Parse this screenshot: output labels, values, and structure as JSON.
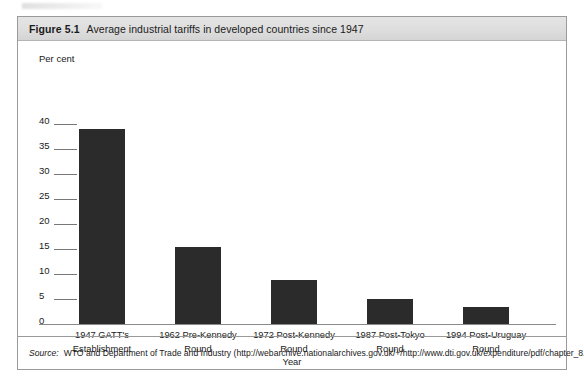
{
  "figure": {
    "number": "Figure 5.1",
    "title": "Average industrial tariffs in developed countries since 1947",
    "source_label": "Source:",
    "source_text": "WTO and Department of Trade and Industry (http://webarchive.nationalarchives.gov.uk/+/http://www.dti.gov.uk/expenditure/pdf/chapter_8.pdf)."
  },
  "chart_data": {
    "type": "bar",
    "title": "Average industrial tariffs in developed countries since 1947",
    "xlabel": "Year",
    "ylabel": "Per cent",
    "ylim": [
      0,
      40
    ],
    "yticks": [
      "0",
      "5",
      "10",
      "15",
      "20",
      "25",
      "30",
      "35",
      "40"
    ],
    "grid": false,
    "legend": "none",
    "bar_color": "#2b2b2b",
    "categories": [
      "1947 GATT's\nEstablishment",
      "1962 Pre-Kennedy\nRound",
      "1972 Post-Kennedy\nRound",
      "1987 Post-Tokyo\nRound",
      "1994 Post-Uruguay\nRound"
    ],
    "category_lines": [
      [
        "1947 GATT's",
        "Establishment"
      ],
      [
        "1962 Pre-Kennedy",
        "Round"
      ],
      [
        "1972 Post-Kennedy",
        "Round"
      ],
      [
        "1987 Post-Tokyo",
        "Round"
      ],
      [
        "1994 Post-Uruguay",
        "Round"
      ]
    ],
    "values": [
      39,
      15.5,
      8.8,
      5,
      3.5
    ]
  }
}
